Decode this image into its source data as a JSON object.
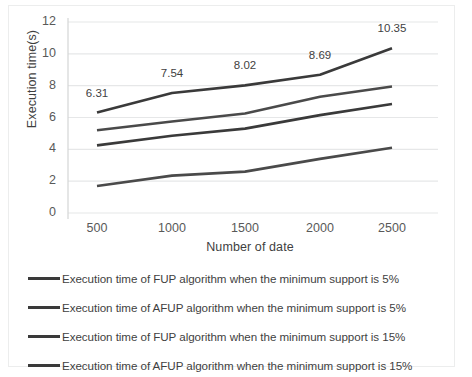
{
  "chart_data": {
    "type": "line",
    "title": "",
    "xlabel": "Number  of date",
    "ylabel": "Execution time(s)",
    "categories": [
      500,
      1000,
      1500,
      2000,
      2500
    ],
    "x_tick_labels": [
      "500",
      "1000",
      "1500",
      "2000",
      "2500"
    ],
    "y_tick_labels": [
      "0",
      "2",
      "4",
      "6",
      "8",
      "10",
      "12"
    ],
    "ylim": [
      0,
      12
    ],
    "ystep": 2,
    "grid": "horizontal",
    "legend_position": "bottom",
    "series": [
      {
        "name": "Execution time of FUP algorithm when the minimum support is 5%",
        "color": "#3a3a3a",
        "values": [
          6.31,
          7.54,
          8.02,
          8.69,
          10.35
        ],
        "data_labels": [
          "6.31",
          "7.54",
          "8.02",
          "8.69",
          "10.35"
        ]
      },
      {
        "name": "Execution time of AFUP algorithm when the minimum support is 5%",
        "color": "#4a4a4a",
        "values": [
          5.2,
          5.75,
          6.25,
          7.3,
          7.95
        ],
        "data_labels": []
      },
      {
        "name": "Execution time of FUP algorithm when the minimum support is 15%",
        "color": "#3a3a3a",
        "values": [
          4.25,
          4.85,
          5.3,
          6.15,
          6.85
        ],
        "data_labels": []
      },
      {
        "name": "Execution time of AFUP algorithm when the minimum support is 15%",
        "color": "#4a4a4a",
        "values": [
          1.7,
          2.35,
          2.6,
          3.4,
          4.1
        ],
        "data_labels": []
      }
    ]
  },
  "legend": {
    "items": [
      "Execution time of FUP algorithm when the minimum support is 5%",
      "Execution time of AFUP algorithm when the minimum support is 5%",
      "Execution time of FUP algorithm when the minimum support is 15%",
      "Execution time of AFUP algorithm when the minimum support is 15%"
    ]
  }
}
